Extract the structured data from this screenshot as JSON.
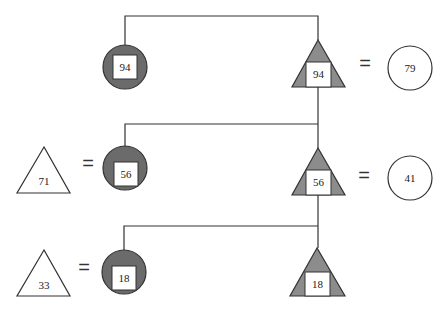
{
  "colors": {
    "circle_fill": "#6b6b6b",
    "triangle_fill": "#8c8c8c",
    "stroke": "#333333",
    "box_fill": "#ffffff"
  },
  "rows": [
    {
      "left_triangle": null,
      "circle": {
        "value": "94"
      },
      "center_triangle": {
        "value": "94"
      },
      "right_circle": {
        "value": "79"
      }
    },
    {
      "left_triangle": {
        "value": "71"
      },
      "circle": {
        "value": "56"
      },
      "center_triangle": {
        "value": "56"
      },
      "right_circle": {
        "value": "41"
      }
    },
    {
      "left_triangle": {
        "value": "33"
      },
      "circle": {
        "value": "18"
      },
      "center_triangle": {
        "value": "18"
      },
      "right_circle": null
    }
  ],
  "equals_symbol": "="
}
